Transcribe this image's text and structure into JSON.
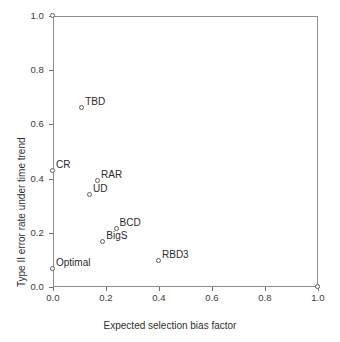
{
  "chart_data": {
    "type": "scatter",
    "title": "",
    "xlabel": "Expected selection bias factor",
    "ylabel": "Type II error rate under time trend",
    "xlim": [
      0.0,
      1.0
    ],
    "ylim": [
      0.0,
      1.0
    ],
    "xticks": [
      "0.0",
      "0.2",
      "0.4",
      "0.6",
      "0.8",
      "1.0"
    ],
    "xtickvalues": [
      0.0,
      0.2,
      0.4,
      0.6,
      0.8,
      1.0
    ],
    "yticks": [
      "0.0",
      "0.2",
      "0.4",
      "0.6",
      "0.8",
      "1.0"
    ],
    "ytickvalues": [
      0.0,
      0.2,
      0.4,
      0.6,
      0.8,
      1.0
    ],
    "grid": false,
    "legend": "none",
    "marker": "open-circle",
    "points": [
      {
        "label": "",
        "x": 0.0,
        "y": 1.0,
        "label_pos": "none"
      },
      {
        "label": "TBD",
        "x": 0.11,
        "y": 0.66,
        "label_pos": "upper-right"
      },
      {
        "label": "CR",
        "x": 0.0,
        "y": 0.428,
        "label_pos": "upper-right"
      },
      {
        "label": "RAR",
        "x": 0.17,
        "y": 0.392,
        "label_pos": "upper-right"
      },
      {
        "label": "UD",
        "x": 0.14,
        "y": 0.34,
        "label_pos": "upper-right"
      },
      {
        "label": "BCD",
        "x": 0.24,
        "y": 0.215,
        "label_pos": "upper-right"
      },
      {
        "label": "BigS",
        "x": 0.19,
        "y": 0.166,
        "label_pos": "upper-right"
      },
      {
        "label": "RBD3",
        "x": 0.4,
        "y": 0.095,
        "label_pos": "upper-right"
      },
      {
        "label": "Optimal",
        "x": 0.0,
        "y": 0.065,
        "label_pos": "upper-right"
      },
      {
        "label": "",
        "x": 1.0,
        "y": 0.0,
        "label_pos": "none"
      }
    ]
  },
  "colors": {
    "background": "#ffffff",
    "frame": "#8e8e8e",
    "marker_edge": "#5d5d5d",
    "text": "#2b2b2b"
  }
}
